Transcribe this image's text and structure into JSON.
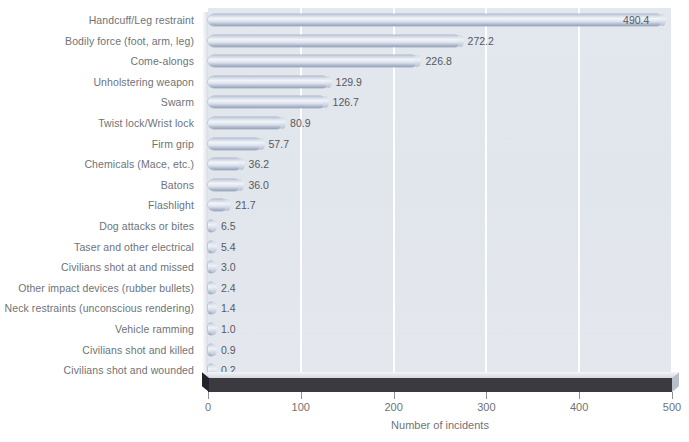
{
  "chart_data": {
    "type": "bar",
    "orientation": "horizontal",
    "title": "",
    "xlabel": "Number of incidents",
    "ylabel": "",
    "xlim": [
      0,
      500
    ],
    "xticks": [
      0,
      100,
      200,
      300,
      400,
      500
    ],
    "grid": "vertical-white-gridlines",
    "legend": "none",
    "categories": [
      "Handcuff/Leg restraint",
      "Bodily force (foot, arm, leg)",
      "Come-alongs",
      "Unholstering weapon",
      "Swarm",
      "Twist lock/Wrist lock",
      "Firm grip",
      "Chemicals (Mace, etc.)",
      "Batons",
      "Flashlight",
      "Dog attacks or bites",
      "Taser and other electrical",
      "Civilians shot at and missed",
      "Other impact devices (rubber bullets)",
      "Neck restraints (unconscious rendering)",
      "Vehicle ramming",
      "Civilians shot and killed",
      "Civilians shot and wounded"
    ],
    "values": [
      490.4,
      272.2,
      226.8,
      129.9,
      126.7,
      80.9,
      57.7,
      36.2,
      36.0,
      21.7,
      6.5,
      5.4,
      3.0,
      2.4,
      1.4,
      1.0,
      0.9,
      0.2
    ],
    "value_labels": [
      "490.4",
      "272.2",
      "226.8",
      "129.9",
      "126.7",
      "80.9",
      "57.7",
      "36.2",
      "36.0",
      "21.7",
      "6.5",
      "5.4",
      "3.0",
      "2.4",
      "1.4",
      "1.0",
      "0.9",
      "0.2"
    ],
    "tick_labels": [
      "0",
      "100",
      "200",
      "300",
      "400",
      "500"
    ],
    "colors": {
      "plot_background": "#e2e6ed",
      "gridline": "#ffffff",
      "bar_light": "#f2f5f9",
      "bar_mid": "#c3ccdb",
      "bar_dark": "#95a2b9",
      "base_slab": "#3a3a40",
      "label_text": "#6e7378",
      "value_text": "#55595f",
      "page_background": "#ffffff"
    }
  }
}
